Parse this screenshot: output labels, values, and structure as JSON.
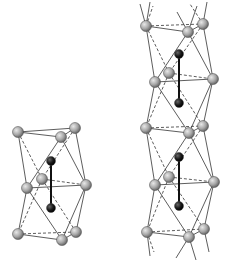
{
  "figure": {
    "colors": {
      "background": "#ffffff",
      "grey_atom": "#a8a8a8",
      "dark_atom": "#1a1a1a",
      "edge": "#333333"
    },
    "structures": [
      {
        "name": "single-unit",
        "atoms_grey": 9,
        "atoms_dark": 2
      },
      {
        "name": "stacked-column",
        "atoms_grey": 15,
        "atoms_dark": 4
      }
    ]
  }
}
